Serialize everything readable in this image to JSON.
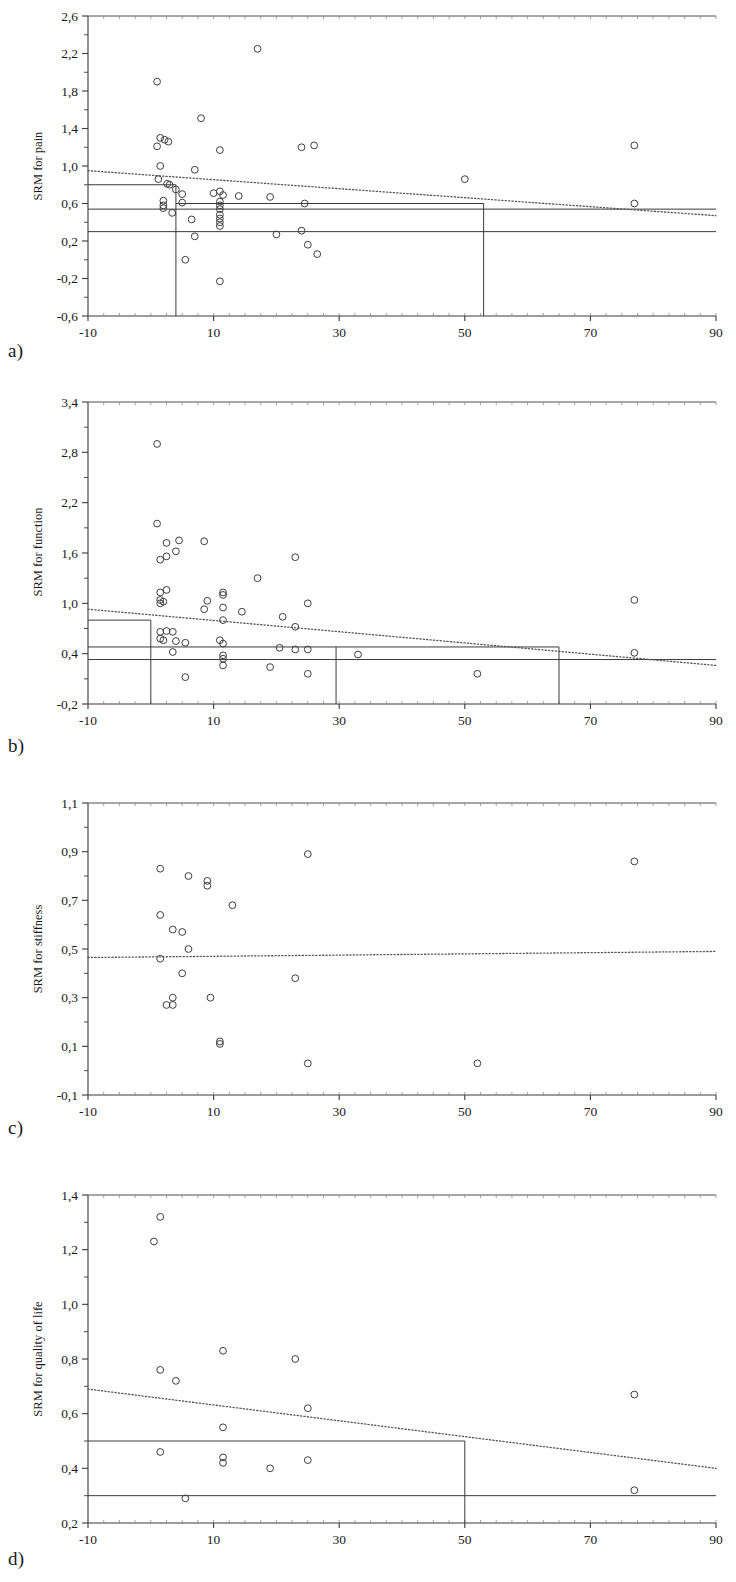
{
  "figure": {
    "panel_letters": [
      "a)",
      "b)",
      "c)",
      "d)"
    ],
    "xlabel": "Follow up (weeks)"
  },
  "chart_data": [
    {
      "panel": "a",
      "type": "scatter",
      "title": "",
      "xlabel": "Follow up (weeks)",
      "ylabel": "SRM for pain",
      "xlim": [
        -10,
        90
      ],
      "ylim": [
        -0.6,
        2.6
      ],
      "xticks": [
        -10,
        10,
        30,
        50,
        70,
        90
      ],
      "xtick_labels": [
        "-10",
        "10",
        "30",
        "50",
        "70",
        "90"
      ],
      "yticks": [
        -0.6,
        -0.2,
        0.2,
        0.6,
        1.0,
        1.4,
        1.8,
        2.2,
        2.6
      ],
      "ytick_labels": [
        "-0,6",
        "-0,2",
        "0,2",
        "0,6",
        "1,0",
        "1,4",
        "1,8",
        "2,2",
        "2,6"
      ],
      "grid": false,
      "legend": "none",
      "points": [
        [
          1.0,
          1.9
        ],
        [
          17.0,
          2.25
        ],
        [
          8.0,
          1.51
        ],
        [
          1.5,
          1.3
        ],
        [
          2.2,
          1.28
        ],
        [
          2.8,
          1.26
        ],
        [
          1.0,
          1.21
        ],
        [
          11.0,
          1.17
        ],
        [
          24.0,
          1.2
        ],
        [
          26.0,
          1.22
        ],
        [
          77.0,
          1.22
        ],
        [
          1.5,
          1.0
        ],
        [
          7.0,
          0.96
        ],
        [
          1.2,
          0.86
        ],
        [
          2.6,
          0.81
        ],
        [
          3.0,
          0.8
        ],
        [
          4.0,
          0.75
        ],
        [
          11.0,
          0.73
        ],
        [
          5.0,
          0.7
        ],
        [
          10.0,
          0.71
        ],
        [
          11.5,
          0.69
        ],
        [
          14.0,
          0.68
        ],
        [
          2.0,
          0.63
        ],
        [
          2.0,
          0.58
        ],
        [
          2.0,
          0.55
        ],
        [
          5.0,
          0.61
        ],
        [
          11.0,
          0.62
        ],
        [
          11.0,
          0.58
        ],
        [
          11.0,
          0.54
        ],
        [
          19.0,
          0.67
        ],
        [
          24.5,
          0.6
        ],
        [
          50.0,
          0.86
        ],
        [
          77.0,
          0.6
        ],
        [
          3.4,
          0.5
        ],
        [
          11.0,
          0.48
        ],
        [
          11.0,
          0.44
        ],
        [
          6.5,
          0.43
        ],
        [
          11.0,
          0.4
        ],
        [
          11.0,
          0.36
        ],
        [
          20.0,
          0.27
        ],
        [
          24.0,
          0.31
        ],
        [
          7.0,
          0.25
        ],
        [
          25.0,
          0.16
        ],
        [
          26.5,
          0.06
        ],
        [
          5.5,
          0.0
        ],
        [
          11.0,
          -0.23
        ]
      ],
      "trend_line": {
        "style": "dotted",
        "x": [
          -10,
          90
        ],
        "y": [
          0.95,
          0.47
        ]
      },
      "pooled_lines": [
        {
          "style": "solid",
          "y": 0.8,
          "x_start": -10,
          "x_end": 4.0
        },
        {
          "style": "solid",
          "y": 0.54,
          "x_start": -10,
          "x_end": 90
        },
        {
          "style": "solid",
          "y": 0.3,
          "x_start": -10,
          "x_end": 90
        },
        {
          "style": "solid",
          "y": 0.6,
          "x_start": 4.0,
          "x_end": 53.0
        }
      ],
      "vertical_markers": [
        {
          "x": 4.0,
          "y_start": -0.6,
          "y_end": 0.8
        },
        {
          "x": 53.0,
          "y_start": -0.6,
          "y_end": 0.6
        }
      ]
    },
    {
      "panel": "b",
      "type": "scatter",
      "title": "",
      "xlabel": "Follow up (weeks)",
      "ylabel": "SRM for function",
      "xlim": [
        -10,
        90
      ],
      "ylim": [
        -0.2,
        3.4
      ],
      "xticks": [
        -10,
        10,
        30,
        50,
        70,
        90
      ],
      "xtick_labels": [
        "-10",
        "10",
        "30",
        "50",
        "70",
        "90"
      ],
      "yticks": [
        -0.2,
        0.4,
        1.0,
        1.6,
        2.2,
        2.8,
        3.4
      ],
      "ytick_labels": [
        "-0,2",
        "0,4",
        "1,0",
        "1,6",
        "2,2",
        "2,8",
        "3,4"
      ],
      "grid": false,
      "legend": "none",
      "points": [
        [
          1.0,
          2.9
        ],
        [
          1.0,
          1.95
        ],
        [
          2.5,
          1.72
        ],
        [
          4.5,
          1.75
        ],
        [
          8.5,
          1.74
        ],
        [
          1.5,
          1.52
        ],
        [
          2.5,
          1.56
        ],
        [
          4.0,
          1.62
        ],
        [
          23.0,
          1.55
        ],
        [
          17.0,
          1.3
        ],
        [
          1.5,
          1.13
        ],
        [
          2.5,
          1.16
        ],
        [
          11.5,
          1.13
        ],
        [
          11.5,
          1.1
        ],
        [
          1.5,
          1.04
        ],
        [
          1.5,
          1.0
        ],
        [
          2.0,
          1.02
        ],
        [
          9.0,
          1.03
        ],
        [
          25.0,
          1.0
        ],
        [
          77.0,
          1.04
        ],
        [
          8.5,
          0.93
        ],
        [
          11.5,
          0.95
        ],
        [
          14.5,
          0.9
        ],
        [
          21.0,
          0.84
        ],
        [
          11.5,
          0.8
        ],
        [
          23.0,
          0.72
        ],
        [
          1.5,
          0.66
        ],
        [
          2.5,
          0.67
        ],
        [
          3.5,
          0.66
        ],
        [
          1.5,
          0.58
        ],
        [
          2.0,
          0.56
        ],
        [
          4.0,
          0.55
        ],
        [
          5.5,
          0.53
        ],
        [
          11.0,
          0.56
        ],
        [
          11.5,
          0.52
        ],
        [
          20.5,
          0.47
        ],
        [
          23.0,
          0.45
        ],
        [
          25.0,
          0.45
        ],
        [
          33.0,
          0.39
        ],
        [
          77.0,
          0.41
        ],
        [
          3.5,
          0.42
        ],
        [
          11.5,
          0.38
        ],
        [
          11.5,
          0.34
        ],
        [
          11.5,
          0.26
        ],
        [
          19.0,
          0.24
        ],
        [
          25.0,
          0.16
        ],
        [
          5.5,
          0.12
        ],
        [
          52.0,
          0.16
        ]
      ],
      "trend_line": {
        "style": "dotted",
        "x": [
          -10,
          90
        ],
        "y": [
          0.93,
          0.26
        ]
      },
      "pooled_lines": [
        {
          "style": "solid",
          "y": 0.8,
          "x_start": -10,
          "x_end": 0.0
        },
        {
          "style": "solid",
          "y": 0.48,
          "x_start": -10,
          "x_end": 29.5
        },
        {
          "style": "solid",
          "y": 0.33,
          "x_start": -10,
          "x_end": 90
        },
        {
          "style": "solid",
          "y": 0.48,
          "x_start": 29.5,
          "x_end": 65.0
        }
      ],
      "vertical_markers": [
        {
          "x": 0.0,
          "y_start": -0.2,
          "y_end": 0.8
        },
        {
          "x": 29.5,
          "y_start": -0.2,
          "y_end": 0.48
        },
        {
          "x": 65.0,
          "y_start": -0.2,
          "y_end": 0.48
        }
      ]
    },
    {
      "panel": "c",
      "type": "scatter",
      "title": "",
      "xlabel": "Follow up (weeks)",
      "ylabel": "SRM for stiffness",
      "xlim": [
        -10,
        90
      ],
      "ylim": [
        -0.1,
        1.1
      ],
      "xticks": [
        -10,
        10,
        30,
        50,
        70,
        90
      ],
      "xtick_labels": [
        "-10",
        "10",
        "30",
        "50",
        "70",
        "90"
      ],
      "yticks": [
        -0.1,
        0.1,
        0.3,
        0.5,
        0.7,
        0.9,
        1.1
      ],
      "ytick_labels": [
        "-0,1",
        "0,1",
        "0,3",
        "0,5",
        "0,7",
        "0,9",
        "1,1"
      ],
      "grid": false,
      "legend": "none",
      "points": [
        [
          1.5,
          0.83
        ],
        [
          25.0,
          0.89
        ],
        [
          77.0,
          0.86
        ],
        [
          6.0,
          0.8
        ],
        [
          9.0,
          0.78
        ],
        [
          9.0,
          0.76
        ],
        [
          13.0,
          0.68
        ],
        [
          1.5,
          0.64
        ],
        [
          3.5,
          0.58
        ],
        [
          5.0,
          0.57
        ],
        [
          6.0,
          0.5
        ],
        [
          1.5,
          0.46
        ],
        [
          5.0,
          0.4
        ],
        [
          23.0,
          0.38
        ],
        [
          3.5,
          0.3
        ],
        [
          9.5,
          0.3
        ],
        [
          2.5,
          0.27
        ],
        [
          3.5,
          0.27
        ],
        [
          11.0,
          0.11
        ],
        [
          11.0,
          0.12
        ],
        [
          25.0,
          0.03
        ],
        [
          52.0,
          0.03
        ]
      ],
      "trend_line": {
        "style": "dotted",
        "x": [
          -10,
          90
        ],
        "y": [
          0.465,
          0.49
        ]
      },
      "pooled_lines": [],
      "vertical_markers": []
    },
    {
      "panel": "d",
      "type": "scatter",
      "title": "",
      "xlabel": "Follow up (weeks)",
      "ylabel": "SRM for quality of life",
      "xlim": [
        -10,
        90
      ],
      "ylim": [
        0.2,
        1.4
      ],
      "xticks": [
        -10,
        10,
        30,
        50,
        70,
        90
      ],
      "xtick_labels": [
        "-10",
        "10",
        "30",
        "50",
        "70",
        "90"
      ],
      "yticks": [
        0.2,
        0.4,
        0.6,
        0.8,
        1.0,
        1.2,
        1.4
      ],
      "ytick_labels": [
        "0,2",
        "0,4",
        "0,6",
        "0,8",
        "1,0",
        "1,2",
        "1,4"
      ],
      "grid": false,
      "legend": "none",
      "points": [
        [
          1.5,
          1.32
        ],
        [
          0.5,
          1.23
        ],
        [
          11.5,
          0.83
        ],
        [
          1.5,
          0.76
        ],
        [
          23.0,
          0.8
        ],
        [
          4.0,
          0.72
        ],
        [
          25.0,
          0.62
        ],
        [
          11.5,
          0.55
        ],
        [
          77.0,
          0.67
        ],
        [
          1.5,
          0.46
        ],
        [
          11.5,
          0.44
        ],
        [
          11.5,
          0.42
        ],
        [
          25.0,
          0.43
        ],
        [
          19.0,
          0.4
        ],
        [
          77.0,
          0.32
        ],
        [
          5.5,
          0.29
        ]
      ],
      "trend_line": {
        "style": "dotted",
        "x": [
          -10,
          90
        ],
        "y": [
          0.69,
          0.4
        ]
      },
      "pooled_lines": [
        {
          "style": "solid",
          "y": 0.5,
          "x_start": -10,
          "x_end": 50.0
        },
        {
          "style": "solid",
          "y": 0.3,
          "x_start": -10,
          "x_end": 90
        }
      ],
      "vertical_markers": [
        {
          "x": 50.0,
          "y_start": 0.2,
          "y_end": 0.5
        }
      ]
    }
  ]
}
